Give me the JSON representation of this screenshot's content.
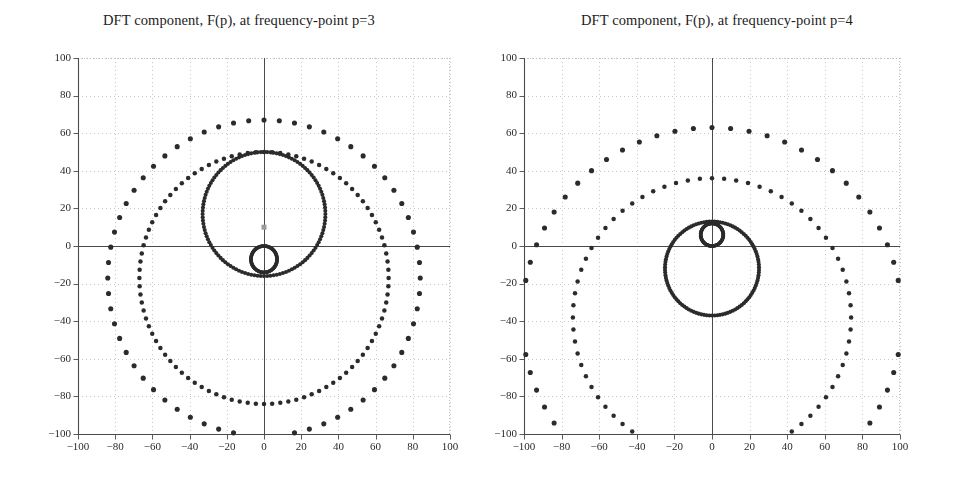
{
  "figure": {
    "width": 956,
    "height": 486,
    "background": "#ffffff",
    "marker_color": "#2b2b2b",
    "axis_color": "#4a4a4a",
    "grid_color": "#b9b9b9",
    "tick_label_color": "#2a2a2a",
    "highlight_marker_color": "#9a9a9a"
  },
  "panels": [
    {
      "id": "left",
      "title": "DFT component, F(p), at frequency-point p=3",
      "origin_px": {
        "x": 264,
        "y": 243
      },
      "plot_box_px": {
        "left": 78,
        "top": 58,
        "right": 450,
        "bottom": 434
      },
      "chart_data": {
        "type": "scatter",
        "title": "DFT component, F(p), at frequency-point p=3",
        "xlabel": "",
        "ylabel": "",
        "xlim": [
          -100,
          100
        ],
        "ylim": [
          -100,
          100
        ],
        "xticks": [
          -100,
          -80,
          -60,
          -40,
          -20,
          0,
          20,
          40,
          60,
          80,
          100
        ],
        "yticks": [
          -100,
          -80,
          -60,
          -40,
          -20,
          0,
          20,
          40,
          60,
          80,
          100
        ],
        "grid": true,
        "legend": "none",
        "highlight_point": {
          "x": 0,
          "y": 10
        },
        "series": [
          {
            "name": "outer-orbit",
            "comment": "sparse large circular locus",
            "marker_size": 4.0,
            "center": [
              0,
              -17
            ],
            "radius": 84,
            "n_points": 64,
            "phase_deg": 90,
            "turns": 1
          },
          {
            "name": "middle-orbit",
            "comment": "medium circular locus, denser sampling",
            "marker_size": 3.4,
            "center": [
              0,
              -17
            ],
            "radius": 67,
            "n_points": 96,
            "phase_deg": 90,
            "turns": 1
          },
          {
            "name": "inner-orbit",
            "comment": "dense small circle through the origin region",
            "marker_size": 3.0,
            "center": [
              0,
              17
            ],
            "radius": 33,
            "n_points": 120,
            "phase_deg": -90,
            "turns": 1
          },
          {
            "name": "origin-loop",
            "comment": "tiny dense loop just below the origin",
            "marker_size": 2.6,
            "center": [
              0,
              -7
            ],
            "radius": 7,
            "n_points": 110,
            "phase_deg": 90,
            "turns": 1
          }
        ]
      }
    },
    {
      "id": "right",
      "title": "DFT component, F(p), at frequency-point p=4",
      "origin_px": {
        "x": 712,
        "y": 243
      },
      "plot_box_px": {
        "left": 524,
        "top": 58,
        "right": 900,
        "bottom": 434
      },
      "chart_data": {
        "type": "scatter",
        "title": "DFT component, F(p), at frequency-point p=4",
        "xlabel": "",
        "ylabel": "",
        "xlim": [
          -100,
          100
        ],
        "ylim": [
          -100,
          100
        ],
        "xticks": [
          -100,
          -80,
          -60,
          -40,
          -20,
          0,
          20,
          40,
          60,
          80,
          100
        ],
        "yticks": [
          -100,
          -80,
          -60,
          -40,
          -20,
          0,
          20,
          40,
          60,
          80,
          100
        ],
        "grid": true,
        "legend": "none",
        "highlight_point": null,
        "series": [
          {
            "name": "outer-orbit",
            "comment": "sparse large circular locus",
            "marker_size": 4.0,
            "center": [
              0,
              -38
            ],
            "radius": 101,
            "n_points": 64,
            "phase_deg": 90,
            "turns": 1
          },
          {
            "name": "middle-orbit",
            "comment": "medium circular locus",
            "marker_size": 3.4,
            "center": [
              0,
              -38
            ],
            "radius": 74,
            "n_points": 72,
            "phase_deg": 90,
            "turns": 1
          },
          {
            "name": "inner-orbit",
            "comment": "dense small circle",
            "marker_size": 3.0,
            "center": [
              0,
              -12
            ],
            "radius": 25,
            "n_points": 110,
            "phase_deg": 90,
            "turns": 1
          },
          {
            "name": "origin-loop",
            "comment": "tiny dense loop at the origin",
            "marker_size": 2.6,
            "center": [
              0,
              6
            ],
            "radius": 6,
            "n_points": 100,
            "phase_deg": -90,
            "turns": 1
          }
        ]
      }
    }
  ]
}
